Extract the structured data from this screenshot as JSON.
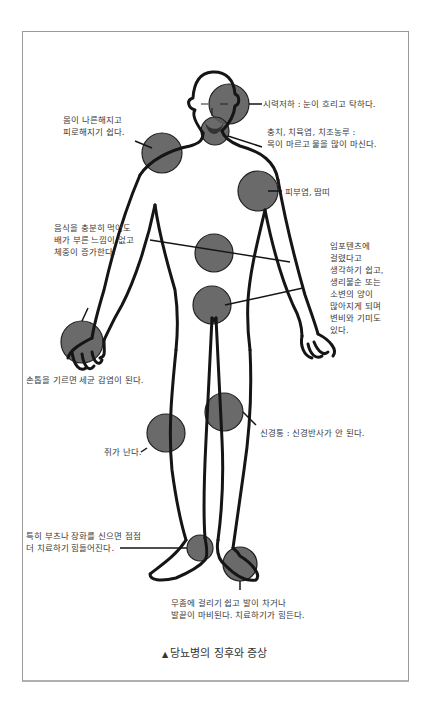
{
  "figure": {
    "caption_marker": "▲",
    "caption": "당뇨병의 징후와 증상",
    "circle_color": "#5a5a5a",
    "line_color": "#1a1a1a",
    "labels": [
      {
        "id": "vision",
        "text": "시력저하 : 눈이 흐리고 탁하다."
      },
      {
        "id": "teeth",
        "text": "충치, 치육염, 치조농루 :\n목이 마르고 물을 많이 마신다."
      },
      {
        "id": "fatigue",
        "text": "몸이 나른해지고\n피로해지기 쉽다."
      },
      {
        "id": "skin",
        "text": "피부염, 땀띠"
      },
      {
        "id": "appetite",
        "text": "음식을 충분히 먹어도\n배가 부른 느낌이 없고\n체중이 증가한다."
      },
      {
        "id": "urinary",
        "text": "임포텐츠에\n걸렸다고\n생각하기 쉽고,\n생리불순 또는\n소변의 양이\n많아지게 되며\n변비와 기미도\n있다."
      },
      {
        "id": "nails",
        "text": "손톱을 기르면 세균 감염이 된다."
      },
      {
        "id": "neuralgia",
        "text": "신경통 : 신경반사가 안 된다."
      },
      {
        "id": "cramp",
        "text": "쥐가 난다."
      },
      {
        "id": "boots",
        "text": "특히 부츠나 장화를 신으면 점점\n더 치료하기 힘들어진다."
      },
      {
        "id": "athletes_foot",
        "text": "무좀에 걸리기 쉽고 발이 차거나\n발끝이 마비된다. 치료하기가 힘든다."
      }
    ]
  }
}
